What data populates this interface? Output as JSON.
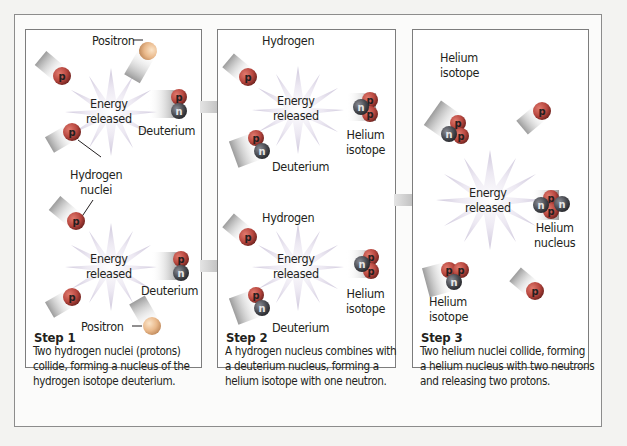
{
  "colors": {
    "proton": "#c0504d",
    "proton_dark": "#7a2622",
    "neutron": "#4a4c52",
    "positron": "#e8b78a",
    "star": "#d8d2e6",
    "arrow": "#bdbdbd",
    "panel_border": "#7d7d7d",
    "text": "#231f20"
  },
  "particle_glyphs": {
    "proton": "p",
    "neutron": "n"
  },
  "steps": [
    {
      "title": "Step 1",
      "description_lines": [
        "Two hydrogen nuclei (protons)",
        "collide, forming a nucleus of the",
        "hydrogen isotope deuterium."
      ],
      "labels": {
        "positron_top": "Positron",
        "energy_top": [
          "Energy",
          "released"
        ],
        "deuterium_top": "Deuterium",
        "hydrogen_nuclei": [
          "Hydrogen",
          "nuclei"
        ],
        "energy_bottom": [
          "Energy",
          "released"
        ],
        "deuterium_bottom": "Deuterium",
        "positron_bottom": "Positron"
      }
    },
    {
      "title": "Step 2",
      "description_lines": [
        "A hydrogen nucleus combines with",
        "a deuterium nucleus, forming a",
        "helium isotope with one neutron."
      ],
      "labels": {
        "hydrogen_top": "Hydrogen",
        "energy_top": [
          "Energy",
          "released"
        ],
        "helium_isotope_top": [
          "Helium",
          "isotope"
        ],
        "deuterium_top": "Deuterium",
        "hydrogen_bottom": "Hydrogen",
        "energy_bottom": [
          "Energy",
          "released"
        ],
        "helium_isotope_bottom": [
          "Helium",
          "isotope"
        ],
        "deuterium_bottom": "Deuterium"
      }
    },
    {
      "title": "Step 3",
      "description_lines": [
        "Two helium nuclei collide, forming",
        "a helium nucleus with two neutrons",
        "and releasing two protons."
      ],
      "labels": {
        "helium_isotope_top": [
          "Helium",
          "isotope"
        ],
        "energy": [
          "Energy",
          "released"
        ],
        "helium_nucleus": [
          "Helium",
          "nucleus"
        ],
        "helium_isotope_bottom": [
          "Helium",
          "isotope"
        ]
      }
    }
  ]
}
